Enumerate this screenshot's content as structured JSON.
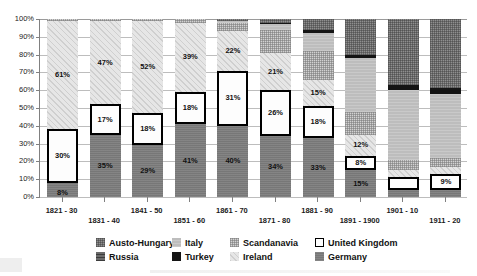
{
  "chart_data": {
    "type": "bar",
    "subtype": "stacked-percentage",
    "title": "",
    "xlabel": "",
    "ylabel": "",
    "ylim": [
      0,
      100
    ],
    "ytick_labels": [
      "0%",
      "10%",
      "20%",
      "30%",
      "40%",
      "50%",
      "60%",
      "70%",
      "80%",
      "90%",
      "100%"
    ],
    "ytick_values": [
      0,
      10,
      20,
      30,
      40,
      50,
      60,
      70,
      80,
      90,
      100
    ],
    "grid": true,
    "legend_position": "bottom",
    "categories": [
      "1821 - 30",
      "1831 - 40",
      "1841 - 50",
      "1851 - 60",
      "1861 - 70",
      "1871 - 80",
      "1881 - 90",
      "1891 - 1900",
      "1901 - 10",
      "1911 - 20"
    ],
    "series": [
      {
        "name": "Germany",
        "key": "germany",
        "values": [
          8,
          35,
          29,
          41,
          40,
          34,
          33,
          15,
          4,
          4
        ]
      },
      {
        "name": "United Kingdom",
        "key": "uk",
        "values": [
          30,
          17,
          18,
          18,
          31,
          26,
          18,
          8,
          7,
          9
        ]
      },
      {
        "name": "Ireland",
        "key": "ireland",
        "values": [
          61,
          47,
          52,
          39,
          22,
          21,
          15,
          12,
          4,
          4
        ]
      },
      {
        "name": "Scandanavia",
        "key": "scand",
        "values": [
          1,
          1,
          1,
          2,
          5,
          13,
          16,
          13,
          6,
          5
        ]
      },
      {
        "name": "Italy",
        "key": "italy",
        "values": [
          0,
          0,
          0,
          0,
          1,
          3,
          10,
          30,
          39,
          36
        ]
      },
      {
        "name": "Turkey",
        "key": "turkey",
        "values": [
          0,
          0,
          0,
          0,
          0,
          1,
          2,
          2,
          3,
          3
        ]
      },
      {
        "name": "Austo-Hungary",
        "key": "austria",
        "values": [
          0,
          0,
          0,
          0,
          1,
          2,
          6,
          20,
          37,
          39
        ]
      }
    ],
    "labeled_values": {
      "germany": [
        "8%",
        "35%",
        "29%",
        "41%",
        "40%",
        "34%",
        "33%",
        "15%",
        "4%",
        "4%"
      ],
      "uk": [
        "30%",
        "17%",
        "18%",
        "18%",
        "31%",
        "26%",
        "18%",
        "8%",
        "7%",
        "9%"
      ],
      "ireland": [
        "61%",
        "47%",
        "52%",
        "39%",
        "22%",
        "21%",
        "15%",
        "12%",
        "4%",
        "4%"
      ]
    }
  },
  "legend": {
    "items": [
      {
        "label": "Austo-Hungary",
        "swatch": "austria"
      },
      {
        "label": "Italy",
        "swatch": "italy"
      },
      {
        "label": "Scandanavia",
        "swatch": "scand"
      },
      {
        "label": "United Kingdom",
        "swatch": "uk"
      },
      {
        "label": "Russia",
        "swatch": "russia"
      },
      {
        "label": "Turkey",
        "swatch": "turkey"
      },
      {
        "label": "Ireland",
        "swatch": "ireland"
      },
      {
        "label": "Germany",
        "swatch": "germany"
      }
    ]
  },
  "colors": {
    "austria": "#8f8f8f",
    "italy": "#c3c3c3",
    "scand": "#d2d2d2",
    "uk": "#fdfdfd",
    "russia": "#6b6b6b",
    "turkey": "#141414",
    "ireland": "#e6e6e6",
    "germany": "#7d7d7d",
    "gridline": "#bdbdbd",
    "axis": "#808080",
    "text": "#1a1a1a"
  }
}
